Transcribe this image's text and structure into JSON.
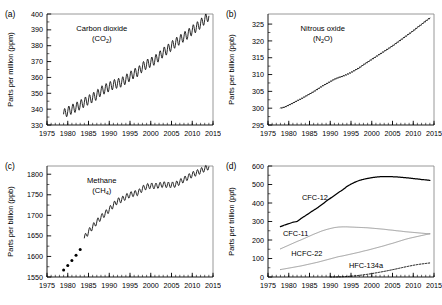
{
  "figure": {
    "panel_letters": [
      "(a)",
      "(b)",
      "(c)",
      "(d)"
    ]
  },
  "chart_data": [
    {
      "panel": "(a)",
      "type": "line",
      "title": "Carbon dioxide",
      "subtitle_formula": "(CO2)",
      "formula_base": "(CO",
      "formula_sub": "2",
      "formula_tail": ")",
      "xlabel": "",
      "ylabel": "Parts per million (ppm)",
      "xlim": [
        1975,
        2015
      ],
      "ylim": [
        330,
        400
      ],
      "xticks": [
        1975,
        1980,
        1985,
        1990,
        1995,
        2000,
        2005,
        2010,
        2015
      ],
      "yticks": [
        330,
        340,
        350,
        360,
        370,
        380,
        390,
        400
      ],
      "minor_x_step": 1,
      "grid": false,
      "legend": "none",
      "series": [
        {
          "name": "CO2 monthly mean",
          "style": "solid-black-sawtooth",
          "seasonal_amplitude_ppm": 6.0,
          "x": [
            1979,
            1980,
            1981,
            1982,
            1983,
            1984,
            1985,
            1986,
            1987,
            1988,
            1989,
            1990,
            1991,
            1992,
            1993,
            1994,
            1995,
            1996,
            1997,
            1998,
            1999,
            2000,
            2001,
            2002,
            2003,
            2004,
            2005,
            2006,
            2007,
            2008,
            2009,
            2010,
            2011,
            2012,
            2013,
            2014
          ],
          "values": [
            337.0,
            338.6,
            340.0,
            341.2,
            342.7,
            344.3,
            345.8,
            347.2,
            348.9,
            351.4,
            352.8,
            354.1,
            355.5,
            356.3,
            357.0,
            358.8,
            360.7,
            362.5,
            363.7,
            366.6,
            368.3,
            369.5,
            371.0,
            373.2,
            375.8,
            377.5,
            379.8,
            381.9,
            383.7,
            385.6,
            387.4,
            389.8,
            391.6,
            393.8,
            396.5,
            398.6
          ]
        }
      ]
    },
    {
      "panel": "(b)",
      "type": "line",
      "title": "Nitrous oxide",
      "subtitle_formula": "(N2O)",
      "formula_base": "(N",
      "formula_sub": "2",
      "formula_tail": "O)",
      "xlabel": "",
      "ylabel": "Parts per billion (ppb)",
      "xlim": [
        1975,
        2015
      ],
      "ylim": [
        295,
        328
      ],
      "xticks": [
        1975,
        1980,
        1985,
        1990,
        1995,
        2000,
        2005,
        2010,
        2015
      ],
      "yticks": [
        295,
        300,
        305,
        310,
        315,
        320,
        325
      ],
      "minor_x_step": 1,
      "grid": false,
      "legend": "none",
      "series": [
        {
          "name": "N2O monthly mean",
          "style": "solid-black",
          "x": [
            1978,
            1979,
            1980,
            1981,
            1982,
            1983,
            1984,
            1985,
            1986,
            1987,
            1988,
            1989,
            1990,
            1991,
            1992,
            1993,
            1994,
            1995,
            1996,
            1997,
            1998,
            1999,
            2000,
            2001,
            2002,
            2003,
            2004,
            2005,
            2006,
            2007,
            2008,
            2009,
            2010,
            2011,
            2012,
            2013,
            2014
          ],
          "values": [
            300.0,
            300.3,
            300.9,
            301.5,
            302.2,
            302.8,
            303.5,
            304.2,
            304.9,
            305.7,
            306.5,
            307.2,
            307.9,
            308.6,
            309.1,
            309.5,
            310.0,
            310.6,
            311.3,
            312.0,
            312.9,
            313.7,
            314.5,
            315.3,
            316.1,
            316.9,
            317.7,
            318.5,
            319.4,
            320.3,
            321.2,
            322.1,
            323.0,
            324.0,
            324.9,
            325.9,
            326.8
          ]
        }
      ]
    },
    {
      "panel": "(c)",
      "type": "line",
      "title": "Methane",
      "subtitle_formula": "(CH4)",
      "formula_base": "(CH",
      "formula_sub": "4",
      "formula_tail": ")",
      "xlabel": "",
      "ylabel": "Parts per billion (ppb)",
      "xlim": [
        1975,
        2015
      ],
      "ylim": [
        1550,
        1820
      ],
      "xticks": [
        1975,
        1980,
        1985,
        1990,
        1995,
        2000,
        2005,
        2010,
        2015
      ],
      "yticks": [
        1550,
        1600,
        1650,
        1700,
        1750,
        1800
      ],
      "minor_x_step": 1,
      "grid": false,
      "legend": "none",
      "series": [
        {
          "name": "CH4 early annual points",
          "style": "black-dots",
          "x": [
            1979,
            1980,
            1981,
            1982,
            1983
          ],
          "values": [
            1567,
            1578,
            1590,
            1603,
            1617
          ]
        },
        {
          "name": "CH4 monthly mean",
          "style": "solid-black-sawtooth",
          "seasonal_amplitude_ppb": 14.0,
          "x": [
            1984,
            1985,
            1986,
            1987,
            1988,
            1989,
            1990,
            1991,
            1992,
            1993,
            1994,
            1995,
            1996,
            1997,
            1998,
            1999,
            2000,
            2001,
            2002,
            2003,
            2004,
            2005,
            2006,
            2007,
            2008,
            2009,
            2010,
            2011,
            2012,
            2013,
            2014
          ],
          "values": [
            1645,
            1660,
            1672,
            1684,
            1695,
            1704,
            1714,
            1725,
            1735,
            1738,
            1745,
            1750,
            1753,
            1755,
            1765,
            1770,
            1772,
            1771,
            1773,
            1775,
            1774,
            1774,
            1775,
            1781,
            1787,
            1793,
            1799,
            1803,
            1808,
            1813,
            1818
          ]
        }
      ]
    },
    {
      "panel": "(d)",
      "type": "line",
      "title": "",
      "xlabel": "",
      "ylabel": "Parts per trillion (ppt)",
      "xlim": [
        1975,
        2015
      ],
      "ylim": [
        0,
        600
      ],
      "xticks": [
        1975,
        1980,
        1985,
        1990,
        1995,
        2000,
        2005,
        2010,
        2015
      ],
      "yticks": [
        0,
        100,
        200,
        300,
        400,
        500,
        600
      ],
      "minor_x_step": 1,
      "grid": false,
      "legend": "inline-labels",
      "series": [
        {
          "name": "CFC-12",
          "label": "CFC-12",
          "style": "solid-black-thick",
          "label_x": 1983.2,
          "label_y": 415,
          "x": [
            1978,
            1979,
            1980,
            1981,
            1982,
            1983,
            1984,
            1985,
            1986,
            1987,
            1988,
            1989,
            1990,
            1991,
            1992,
            1993,
            1994,
            1995,
            1996,
            1997,
            1998,
            1999,
            2000,
            2001,
            2002,
            2003,
            2004,
            2005,
            2006,
            2007,
            2008,
            2009,
            2010,
            2011,
            2012,
            2013,
            2014
          ],
          "values": [
            272,
            281,
            288,
            296,
            300,
            317,
            331,
            346,
            361,
            375,
            392,
            409,
            425,
            441,
            457,
            471,
            489,
            502,
            513,
            522,
            528,
            533,
            537,
            540,
            542,
            543,
            543,
            542,
            541,
            539,
            537,
            535,
            532,
            530,
            527,
            525,
            522
          ]
        },
        {
          "name": "CFC-11",
          "label": "CFC-11",
          "style": "solid-gray",
          "label_x": 1978.6,
          "label_y": 222,
          "x": [
            1978,
            1979,
            1980,
            1981,
            1982,
            1983,
            1984,
            1985,
            1986,
            1987,
            1988,
            1989,
            1990,
            1991,
            1992,
            1993,
            1994,
            1995,
            1996,
            1997,
            1998,
            1999,
            2000,
            2001,
            2002,
            2003,
            2004,
            2005,
            2006,
            2007,
            2008,
            2009,
            2010,
            2011,
            2012,
            2013,
            2014
          ],
          "values": [
            152,
            162,
            172,
            182,
            192,
            201,
            211,
            221,
            231,
            240,
            249,
            256,
            262,
            267,
            270,
            271,
            271,
            270,
            269,
            268,
            267,
            266,
            264,
            262,
            260,
            258,
            255,
            253,
            250,
            248,
            245,
            243,
            241,
            239,
            237,
            235,
            233
          ]
        },
        {
          "name": "HCFC-22",
          "label": "HCFC-22",
          "style": "solid-gray",
          "label_x": 1980.6,
          "label_y": 112,
          "x": [
            1978,
            1979,
            1980,
            1981,
            1982,
            1983,
            1984,
            1985,
            1986,
            1987,
            1988,
            1989,
            1990,
            1991,
            1992,
            1993,
            1994,
            1995,
            1996,
            1997,
            1998,
            1999,
            2000,
            2001,
            2002,
            2003,
            2004,
            2005,
            2006,
            2007,
            2008,
            2009,
            2010,
            2011,
            2012,
            2013,
            2014
          ],
          "values": [
            40,
            44,
            48,
            52,
            56,
            60,
            65,
            70,
            75,
            80,
            86,
            92,
            98,
            104,
            110,
            114,
            119,
            124,
            129,
            134,
            140,
            145,
            151,
            157,
            163,
            169,
            176,
            182,
            189,
            196,
            203,
            209,
            214,
            219,
            224,
            229,
            234
          ]
        },
        {
          "name": "HFC-134a",
          "label": "HFC-134a",
          "style": "dotted-black",
          "label_x": 1994.5,
          "label_y": 46,
          "x": [
            1990,
            1991,
            1992,
            1993,
            1994,
            1995,
            1996,
            1997,
            1998,
            1999,
            2000,
            2001,
            2002,
            2003,
            2004,
            2005,
            2006,
            2007,
            2008,
            2009,
            2010,
            2011,
            2012,
            2013,
            2014
          ],
          "values": [
            0,
            0.3,
            0.8,
            1.6,
            2.8,
            4.4,
            6.4,
            8.8,
            11.6,
            14.8,
            18.4,
            22.2,
            26.2,
            30.4,
            34.8,
            39.4,
            44.2,
            49.2,
            54.2,
            58.8,
            63.2,
            67.2,
            70.4,
            73.2,
            76.0
          ]
        }
      ]
    }
  ]
}
